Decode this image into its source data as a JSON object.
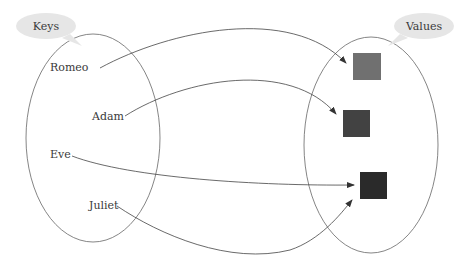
{
  "diagram": {
    "type": "map-keys-to-values",
    "sets": {
      "keys": {
        "title": "Keys",
        "items": [
          "Romeo",
          "Adam",
          "Eve",
          "Juliet"
        ]
      },
      "values": {
        "title": "Values",
        "items": [
          {
            "id": "v1",
            "color": "#707070"
          },
          {
            "id": "v2",
            "color": "#424242"
          },
          {
            "id": "v3",
            "color": "#2a2a2a"
          }
        ]
      }
    },
    "mappings": [
      {
        "from": "Romeo",
        "to": "v1"
      },
      {
        "from": "Adam",
        "to": "v2"
      },
      {
        "from": "Eve",
        "to": "v3"
      },
      {
        "from": "Juliet",
        "to": "v3"
      }
    ],
    "colors": {
      "stroke": "#555555",
      "bubble": "#e6e6e6",
      "text": "#3a3a3a"
    }
  }
}
